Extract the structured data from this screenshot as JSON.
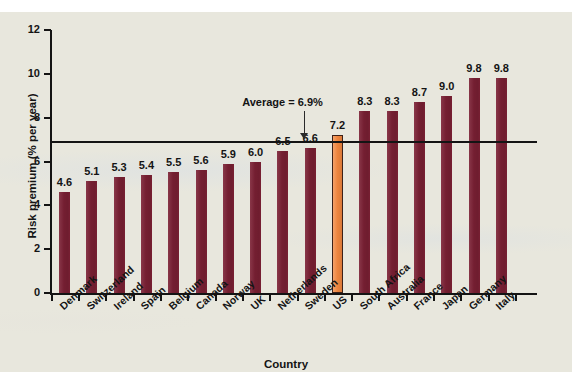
{
  "chart_data": {
    "type": "bar",
    "title": "",
    "xlabel": "Country",
    "ylabel": "Risk premium (% per year)",
    "ylim": [
      0,
      12
    ],
    "yticks": [
      0,
      2,
      4,
      6,
      8,
      10,
      12
    ],
    "grid": false,
    "legend": "none",
    "categories": [
      "Denmark",
      "Switzerland",
      "Ireland",
      "Spain",
      "Belgium",
      "Canada",
      "Norway",
      "UK",
      "Netherlands",
      "Sweden",
      "US",
      "South Africa",
      "Australia",
      "France",
      "Japan",
      "Germany",
      "Italy"
    ],
    "values": [
      4.6,
      5.1,
      5.3,
      5.4,
      5.5,
      5.6,
      5.9,
      6.0,
      6.5,
      6.6,
      7.2,
      8.3,
      8.3,
      8.7,
      9.0,
      9.8,
      9.8
    ],
    "highlight_category": "US",
    "annotations": [
      {
        "name": "average-line",
        "label": "Average = 6.9%",
        "value": 6.9,
        "type": "hline-with-arrow"
      }
    ],
    "colors": {
      "bar": "#7b2034",
      "highlight_bar": "#f2873f",
      "axis": "#141414",
      "background": "#e8e7dd",
      "text": "#141414"
    }
  },
  "axes": {
    "y_title": "Risk premium (% per year)",
    "x_title": "Country",
    "y_tick_labels": [
      "0",
      "2",
      "4",
      "6",
      "8",
      "10",
      "12"
    ]
  },
  "annotation": {
    "average_text": "Average = 6.9%"
  },
  "bar_value_labels": [
    "4.6",
    "5.1",
    "5.3",
    "5.4",
    "5.5",
    "5.6",
    "5.9",
    "6.0",
    "6.5",
    "6.6",
    "7.2",
    "8.3",
    "8.3",
    "8.7",
    "9.0",
    "9.8",
    "9.8"
  ]
}
